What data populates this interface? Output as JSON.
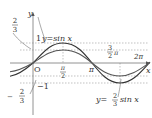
{
  "diagram": {
    "type": "function-graph",
    "curves": [
      {
        "label": "y=sin x",
        "amplitude": 1,
        "color": "#333333"
      },
      {
        "label": "y=2/3 sin x",
        "amplitude": 0.6667,
        "color": "#555555"
      }
    ],
    "axes": {
      "x_label": "x",
      "y_label": "y",
      "origin_label": "O"
    },
    "y_ticks": [
      {
        "label": "1",
        "value": 1
      },
      {
        "label": "2/3",
        "value": 0.6667
      },
      {
        "label": "-1",
        "value": -1
      },
      {
        "label": "-2/3",
        "value": -0.6667
      }
    ],
    "x_ticks": [
      {
        "label": "π/2"
      },
      {
        "label": "π"
      },
      {
        "label": "3/2 π"
      },
      {
        "label": "2π"
      }
    ],
    "labels": {
      "sin_label": "y=sin x",
      "two_thirds_label_prefix": "y=",
      "two_thirds_num": "2",
      "two_thirds_den": "3",
      "two_thirds_suffix": "sin x",
      "one": "1",
      "neg_one": "−1",
      "frac_num": "2",
      "frac_den": "3",
      "minus": "−",
      "pi": "π",
      "two_pi": "2π",
      "three": "3",
      "two": "2",
      "x": "x",
      "y": "y",
      "O": "O"
    }
  }
}
